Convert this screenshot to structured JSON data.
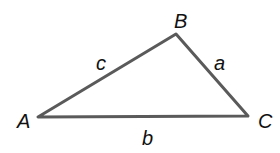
{
  "diagram": {
    "type": "triangle",
    "line_color": "#5a5a5a",
    "vertices": [
      {
        "label": "A",
        "x": 38,
        "y": 117
      },
      {
        "label": "B",
        "x": 176,
        "y": 34
      },
      {
        "label": "C",
        "x": 248,
        "y": 116
      }
    ],
    "sides": [
      {
        "label": "c",
        "from": "A",
        "to": "B"
      },
      {
        "label": "a",
        "from": "B",
        "to": "C"
      },
      {
        "label": "b",
        "from": "A",
        "to": "C"
      }
    ]
  }
}
